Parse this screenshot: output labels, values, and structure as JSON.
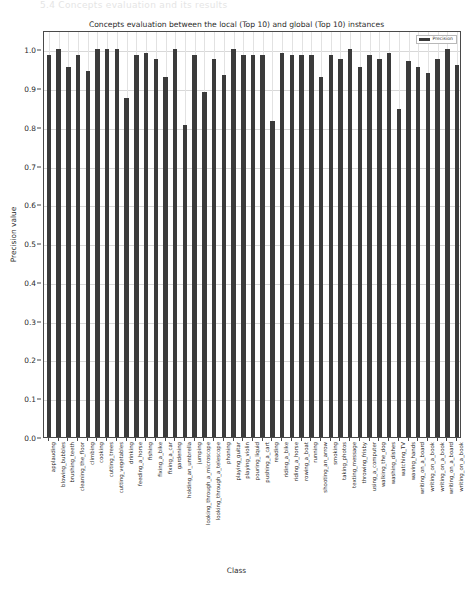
{
  "page_header": "5.4   Concepts evaluation and its results",
  "chart_data": {
    "type": "bar",
    "title": "Concepts evaluation between the local (Top 10) and global (Top 10) instances",
    "xlabel": "Class",
    "ylabel": "Precision value",
    "ylim": [
      0.0,
      1.05
    ],
    "yticks": [
      "0.0",
      "0.1",
      "0.2",
      "0.3",
      "0.4",
      "0.5",
      "0.6",
      "0.7",
      "0.8",
      "0.9",
      "1.0"
    ],
    "ytick_values": [
      0.0,
      0.1,
      0.2,
      0.3,
      0.4,
      0.5,
      0.6,
      0.7,
      0.8,
      0.9,
      1.0
    ],
    "grid": true,
    "legend_position": "upper right",
    "bar_color": "#3b3b3b",
    "series": [
      {
        "name": "Precision",
        "values": [
          0.985,
          1.0,
          0.955,
          0.985,
          0.945,
          1.0,
          1.0,
          1.0,
          0.875,
          0.985,
          0.99,
          0.975,
          0.93,
          1.0,
          0.805,
          0.985,
          0.89,
          0.975,
          0.935,
          1.0,
          0.985,
          0.985,
          0.985,
          0.815,
          0.99,
          0.985,
          0.985,
          0.985,
          0.93,
          0.985,
          0.975,
          1.0,
          0.955,
          0.985,
          0.975,
          0.99,
          0.845,
          0.97,
          0.955,
          0.94,
          0.975,
          1.0,
          0.96
        ]
      }
    ],
    "categories": [
      "applauding",
      "blowing_bubbles",
      "brushing_teeth",
      "cleaning_the_floor",
      "climbing",
      "cooking",
      "cutting_trees",
      "cutting_vegetables",
      "drinking",
      "feeding_a_horse",
      "fishing",
      "fixing_a_bike",
      "fixing_a_car",
      "gardening",
      "holding_an_umbrella",
      "jumping",
      "looking_through_a_microscope",
      "looking_through_a_telescope",
      "phoning",
      "playing_guitar",
      "playing_violin",
      "pouring_liquid",
      "pushing_a_cart",
      "reading",
      "riding_a_bike",
      "riding_a_horse",
      "rowing_a_boat",
      "running",
      "shooting_an_arrow",
      "smoking",
      "taking_photos",
      "texting_message",
      "throwing_frisby",
      "using_a_computer",
      "walking_the_dog",
      "washing_dishes",
      "watching_TV",
      "waving_hands",
      "writing_on_a_board",
      "writing_on_a_book",
      "writing_on_a_book",
      "writing_on_a_board",
      "writing_on_a_book"
    ],
    "legend": [
      {
        "label": "Precision",
        "color": "#3b3b3b"
      }
    ]
  }
}
